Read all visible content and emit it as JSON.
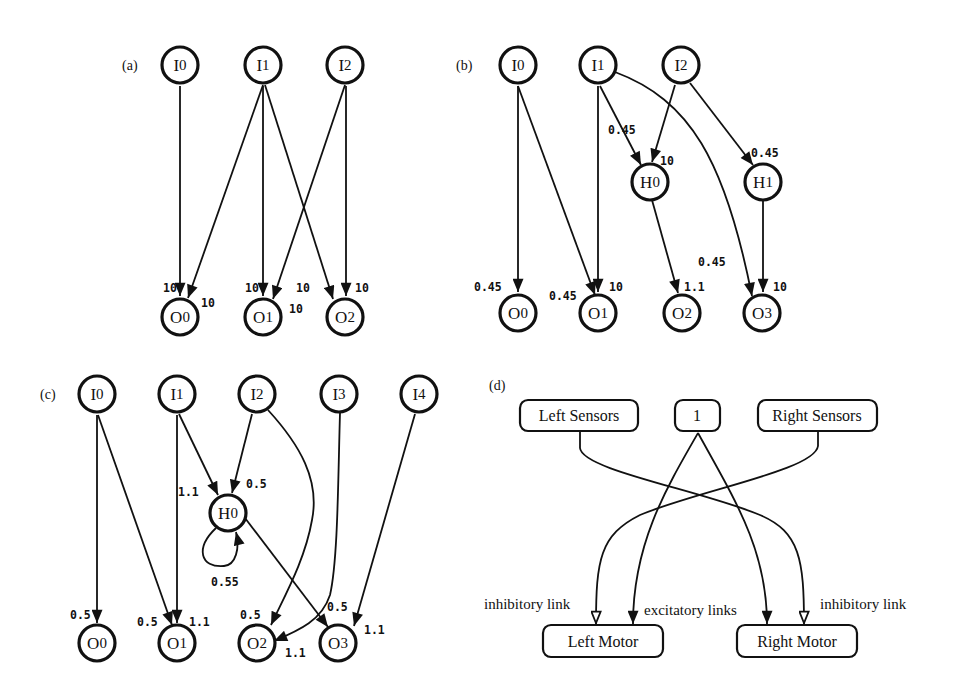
{
  "panels": {
    "a": {
      "label": "(a)",
      "nodes": {
        "I0": {
          "main": "I",
          "sub": "0"
        },
        "I1": {
          "main": "I",
          "sub": "1"
        },
        "I2": {
          "main": "I",
          "sub": "2"
        },
        "O0": {
          "main": "O",
          "sub": "0"
        },
        "O1": {
          "main": "O",
          "sub": "1"
        },
        "O2": {
          "main": "O",
          "sub": "2"
        }
      },
      "edges": [
        {
          "from": "I0",
          "to": "O0",
          "weight": "10"
        },
        {
          "from": "I1",
          "to": "O0",
          "weight": "10"
        },
        {
          "from": "I1",
          "to": "O1",
          "weight": "10"
        },
        {
          "from": "I1",
          "to": "O2",
          "weight": "10"
        },
        {
          "from": "I2",
          "to": "O1",
          "weight": "10"
        },
        {
          "from": "I2",
          "to": "O2",
          "weight": "10"
        }
      ],
      "weights": [
        "10",
        "10",
        "10",
        "10",
        "10",
        "10"
      ]
    },
    "b": {
      "label": "(b)",
      "nodes": {
        "I0": {
          "main": "I",
          "sub": "0"
        },
        "I1": {
          "main": "I",
          "sub": "1"
        },
        "I2": {
          "main": "I",
          "sub": "2"
        },
        "H0": {
          "main": "H",
          "sub": "0"
        },
        "H1": {
          "main": "H",
          "sub": "1"
        },
        "O0": {
          "main": "O",
          "sub": "0"
        },
        "O1": {
          "main": "O",
          "sub": "1"
        },
        "O2": {
          "main": "O",
          "sub": "2"
        },
        "O3": {
          "main": "O",
          "sub": "3"
        }
      },
      "edges": [
        {
          "from": "I0",
          "to": "O0",
          "weight": "0.45"
        },
        {
          "from": "I0",
          "to": "O1",
          "weight": "0.45"
        },
        {
          "from": "I1",
          "to": "O1",
          "weight": "10"
        },
        {
          "from": "I1",
          "to": "H0",
          "weight": "0.45"
        },
        {
          "from": "I1",
          "to": "O3",
          "weight": "0.45"
        },
        {
          "from": "I2",
          "to": "H0",
          "weight": "10"
        },
        {
          "from": "I2",
          "to": "H1",
          "weight": "0.45"
        },
        {
          "from": "H0",
          "to": "O2",
          "weight": "1.1"
        },
        {
          "from": "H1",
          "to": "O3",
          "weight": "10"
        }
      ],
      "weights": [
        "0.45",
        "0.45",
        "10",
        "0.45",
        "0.45",
        "10",
        "0.45",
        "1.1",
        "10"
      ]
    },
    "c": {
      "label": "(c)",
      "nodes": {
        "I0": {
          "main": "I",
          "sub": "0"
        },
        "I1": {
          "main": "I",
          "sub": "1"
        },
        "I2": {
          "main": "I",
          "sub": "2"
        },
        "I3": {
          "main": "I",
          "sub": "3"
        },
        "I4": {
          "main": "I",
          "sub": "4"
        },
        "H0": {
          "main": "H",
          "sub": "0"
        },
        "O0": {
          "main": "O",
          "sub": "0"
        },
        "O1": {
          "main": "O",
          "sub": "1"
        },
        "O2": {
          "main": "O",
          "sub": "2"
        },
        "O3": {
          "main": "O",
          "sub": "3"
        }
      },
      "edges": [
        {
          "from": "I0",
          "to": "O0",
          "weight": "0.5"
        },
        {
          "from": "I0",
          "to": "O1",
          "weight": "0.5"
        },
        {
          "from": "I1",
          "to": "O1",
          "weight": "1.1"
        },
        {
          "from": "I1",
          "to": "H0",
          "weight": "1.1"
        },
        {
          "from": "I2",
          "to": "H0",
          "weight": "0.5"
        },
        {
          "from": "H0",
          "to": "H0",
          "weight": "0.55"
        },
        {
          "from": "I2",
          "to": "O2",
          "weight": "0.5"
        },
        {
          "from": "H0",
          "to": "O3",
          "weight": "0.5"
        },
        {
          "from": "I3",
          "to": "O2",
          "weight": "1.1"
        },
        {
          "from": "I4",
          "to": "O3",
          "weight": "1.1"
        }
      ],
      "weights": [
        "0.5",
        "0.5",
        "1.1",
        "1.1",
        "0.5",
        "0.55",
        "0.5",
        "0.5",
        "1.1",
        "1.1"
      ]
    },
    "d": {
      "label": "(d)",
      "boxes": {
        "left_sensors": "Left Sensors",
        "bias": "1",
        "right_sensors": "Right Sensors",
        "left_motor": "Left Motor",
        "right_motor": "Right Motor"
      },
      "links": [
        {
          "from": "Left Sensors",
          "to": "Right Motor",
          "type": "inhibitory"
        },
        {
          "from": "Right Sensors",
          "to": "Left Motor",
          "type": "inhibitory"
        },
        {
          "from": "1",
          "to": "Left Motor",
          "type": "excitatory"
        },
        {
          "from": "1",
          "to": "Right Motor",
          "type": "excitatory"
        }
      ],
      "legend": {
        "inhibitory_left": "inhibitory link",
        "excitatory": "excitatory links",
        "inhibitory_right": "inhibitory link"
      }
    }
  },
  "colors": {
    "ink": "#111111",
    "background": "#ffffff"
  }
}
